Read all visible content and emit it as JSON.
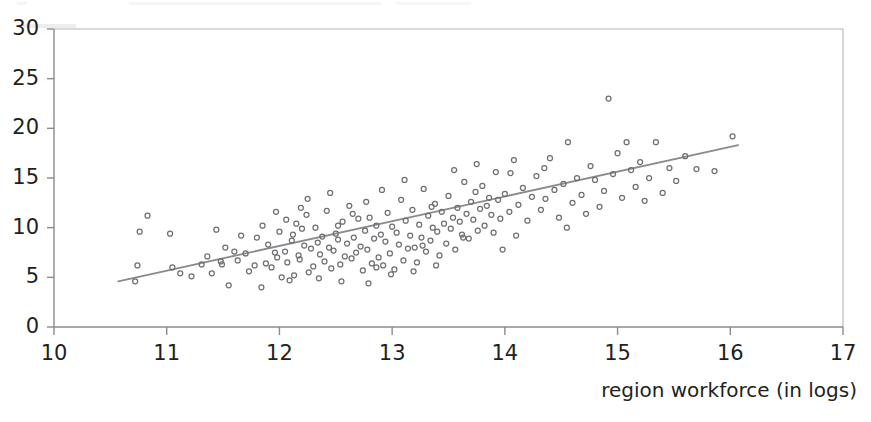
{
  "figure": {
    "background": "#ffffff",
    "width": 871,
    "height": 422
  },
  "axis_style": {
    "axis_color": "#8c8c8c",
    "tick_color": "#8c8c8c",
    "text_color": "#231f20",
    "marker_stroke": "#6f6f73",
    "trendline_color": "#8a8a8f"
  },
  "x_axis": {
    "title": "region workforce (in logs)",
    "ticks": [
      "10",
      "11",
      "12",
      "13",
      "14",
      "15",
      "16",
      "17"
    ]
  },
  "y_axis": {
    "title": "",
    "ticks": [
      "0",
      "5",
      "10",
      "15",
      "20",
      "25",
      "30"
    ]
  },
  "chart_data": {
    "type": "scatter",
    "title": "",
    "xlabel": "region workforce (in logs)",
    "ylabel": "",
    "xlim": [
      10,
      17
    ],
    "ylim": [
      0,
      30
    ],
    "xticks": [
      10,
      11,
      12,
      13,
      14,
      15,
      16,
      17
    ],
    "yticks": [
      0,
      5,
      10,
      15,
      20,
      25,
      30
    ],
    "grid": false,
    "legend": "none",
    "marker": {
      "shape": "circle",
      "filled": false,
      "size": 5
    },
    "series": [
      {
        "name": "regions",
        "n": 196,
        "points": [
          [
            10.72,
            4.6
          ],
          [
            10.74,
            6.2
          ],
          [
            10.76,
            9.6
          ],
          [
            10.83,
            11.2
          ],
          [
            11.03,
            9.4
          ],
          [
            11.05,
            6.0
          ],
          [
            11.12,
            5.4
          ],
          [
            11.22,
            5.1
          ],
          [
            11.31,
            6.3
          ],
          [
            11.36,
            7.1
          ],
          [
            11.4,
            5.4
          ],
          [
            11.44,
            9.8
          ],
          [
            11.48,
            6.6
          ],
          [
            11.49,
            6.3
          ],
          [
            11.52,
            8.0
          ],
          [
            11.55,
            4.2
          ],
          [
            11.6,
            7.6
          ],
          [
            11.63,
            6.7
          ],
          [
            11.66,
            9.2
          ],
          [
            11.7,
            7.4
          ],
          [
            11.73,
            5.6
          ],
          [
            11.78,
            6.2
          ],
          [
            11.8,
            9.0
          ],
          [
            11.84,
            4.0
          ],
          [
            11.88,
            6.4
          ],
          [
            11.9,
            8.3
          ],
          [
            11.93,
            6.0
          ],
          [
            11.96,
            7.5
          ],
          [
            11.98,
            7.0
          ],
          [
            12.0,
            9.6
          ],
          [
            12.02,
            5.0
          ],
          [
            12.05,
            7.6
          ],
          [
            12.07,
            6.5
          ],
          [
            12.09,
            4.7
          ],
          [
            12.11,
            8.7
          ],
          [
            12.13,
            5.2
          ],
          [
            12.15,
            10.4
          ],
          [
            12.17,
            7.2
          ],
          [
            12.18,
            6.8
          ],
          [
            12.2,
            9.9
          ],
          [
            12.22,
            8.2
          ],
          [
            12.24,
            11.3
          ],
          [
            12.26,
            5.5
          ],
          [
            12.28,
            7.9
          ],
          [
            12.3,
            6.1
          ],
          [
            12.32,
            10.0
          ],
          [
            12.34,
            8.5
          ],
          [
            12.36,
            7.3
          ],
          [
            12.38,
            9.1
          ],
          [
            12.4,
            6.6
          ],
          [
            12.42,
            11.7
          ],
          [
            12.44,
            8.0
          ],
          [
            12.46,
            5.9
          ],
          [
            12.48,
            7.7
          ],
          [
            12.5,
            9.4
          ],
          [
            12.52,
            8.8
          ],
          [
            12.54,
            6.3
          ],
          [
            12.56,
            10.6
          ],
          [
            12.58,
            7.1
          ],
          [
            12.6,
            8.4
          ],
          [
            12.62,
            12.2
          ],
          [
            12.64,
            6.9
          ],
          [
            12.66,
            9.0
          ],
          [
            12.68,
            7.5
          ],
          [
            12.7,
            10.9
          ],
          [
            12.72,
            8.1
          ],
          [
            12.74,
            5.7
          ],
          [
            12.76,
            9.7
          ],
          [
            12.78,
            7.8
          ],
          [
            12.8,
            11.0
          ],
          [
            12.82,
            6.4
          ],
          [
            12.84,
            8.9
          ],
          [
            12.86,
            10.2
          ],
          [
            12.88,
            7.0
          ],
          [
            12.9,
            9.3
          ],
          [
            12.92,
            6.2
          ],
          [
            12.94,
            8.6
          ],
          [
            12.96,
            11.5
          ],
          [
            12.98,
            7.4
          ],
          [
            13.0,
            10.1
          ],
          [
            13.02,
            5.8
          ],
          [
            13.04,
            9.5
          ],
          [
            13.06,
            8.3
          ],
          [
            13.08,
            12.8
          ],
          [
            13.1,
            6.7
          ],
          [
            13.12,
            10.7
          ],
          [
            13.14,
            7.9
          ],
          [
            13.16,
            9.2
          ],
          [
            13.18,
            11.8
          ],
          [
            13.2,
            8.0
          ],
          [
            13.22,
            6.5
          ],
          [
            13.24,
            10.3
          ],
          [
            13.26,
            9.0
          ],
          [
            13.28,
            13.9
          ],
          [
            13.3,
            7.6
          ],
          [
            13.32,
            11.2
          ],
          [
            13.34,
            8.7
          ],
          [
            13.36,
            10.0
          ],
          [
            13.38,
            12.4
          ],
          [
            13.4,
            9.6
          ],
          [
            13.42,
            7.2
          ],
          [
            13.44,
            11.6
          ],
          [
            13.46,
            10.4
          ],
          [
            13.48,
            8.4
          ],
          [
            13.5,
            13.2
          ],
          [
            13.52,
            9.9
          ],
          [
            13.54,
            11.0
          ],
          [
            13.56,
            7.8
          ],
          [
            13.58,
            12.0
          ],
          [
            13.6,
            10.6
          ],
          [
            13.62,
            9.3
          ],
          [
            13.64,
            14.6
          ],
          [
            13.66,
            11.4
          ],
          [
            13.68,
            8.9
          ],
          [
            13.7,
            12.6
          ],
          [
            13.72,
            10.8
          ],
          [
            13.74,
            13.6
          ],
          [
            13.76,
            9.7
          ],
          [
            13.78,
            11.9
          ],
          [
            13.8,
            14.2
          ],
          [
            13.82,
            10.2
          ],
          [
            13.84,
            12.2
          ],
          [
            13.86,
            13.0
          ],
          [
            13.88,
            11.3
          ],
          [
            13.9,
            9.5
          ],
          [
            13.92,
            15.6
          ],
          [
            13.94,
            12.8
          ],
          [
            13.96,
            10.9
          ],
          [
            13.98,
            7.8
          ],
          [
            14.0,
            13.4
          ],
          [
            14.04,
            11.6
          ],
          [
            14.08,
            16.8
          ],
          [
            14.12,
            12.3
          ],
          [
            14.16,
            14.0
          ],
          [
            14.2,
            10.7
          ],
          [
            14.24,
            13.1
          ],
          [
            14.28,
            15.2
          ],
          [
            14.32,
            11.8
          ],
          [
            14.36,
            12.9
          ],
          [
            14.4,
            17.0
          ],
          [
            14.44,
            13.8
          ],
          [
            14.48,
            11.0
          ],
          [
            14.52,
            14.4
          ],
          [
            14.56,
            18.6
          ],
          [
            14.6,
            12.5
          ],
          [
            14.64,
            15.0
          ],
          [
            14.68,
            13.3
          ],
          [
            14.72,
            11.4
          ],
          [
            14.76,
            16.2
          ],
          [
            14.8,
            14.8
          ],
          [
            14.84,
            12.1
          ],
          [
            14.88,
            13.7
          ],
          [
            14.92,
            23.0
          ],
          [
            14.96,
            15.4
          ],
          [
            15.0,
            17.5
          ],
          [
            15.04,
            13.0
          ],
          [
            15.08,
            18.6
          ],
          [
            15.12,
            15.8
          ],
          [
            15.16,
            14.1
          ],
          [
            15.2,
            16.6
          ],
          [
            15.24,
            12.7
          ],
          [
            15.28,
            15.0
          ],
          [
            15.34,
            18.6
          ],
          [
            15.4,
            13.5
          ],
          [
            15.46,
            16.0
          ],
          [
            15.52,
            14.7
          ],
          [
            15.6,
            17.2
          ],
          [
            15.7,
            15.9
          ],
          [
            15.86,
            15.7
          ],
          [
            16.02,
            19.2
          ],
          [
            12.06,
            10.8
          ],
          [
            12.19,
            12.0
          ],
          [
            12.35,
            4.9
          ],
          [
            12.55,
            4.6
          ],
          [
            12.79,
            4.4
          ],
          [
            12.99,
            5.3
          ],
          [
            13.19,
            5.6
          ],
          [
            13.39,
            6.2
          ],
          [
            11.97,
            11.6
          ],
          [
            12.45,
            13.5
          ],
          [
            12.77,
            12.6
          ],
          [
            13.11,
            14.8
          ],
          [
            13.55,
            15.8
          ],
          [
            13.75,
            16.4
          ],
          [
            14.05,
            15.5
          ],
          [
            14.35,
            16.0
          ],
          [
            12.25,
            12.9
          ],
          [
            12.65,
            11.4
          ],
          [
            12.91,
            13.8
          ],
          [
            13.35,
            12.1
          ],
          [
            11.85,
            10.2
          ],
          [
            12.12,
            9.3
          ],
          [
            12.52,
            10.2
          ],
          [
            12.86,
            6.0
          ],
          [
            13.27,
            8.2
          ],
          [
            13.63,
            9.0
          ],
          [
            14.1,
            9.2
          ],
          [
            14.55,
            10.0
          ]
        ]
      }
    ],
    "trendline": {
      "type": "linear",
      "x_start": 10.57,
      "y_start": 4.6,
      "x_end": 16.07,
      "y_end": 18.3,
      "slope": 2.49,
      "intercept": -21.76
    }
  }
}
